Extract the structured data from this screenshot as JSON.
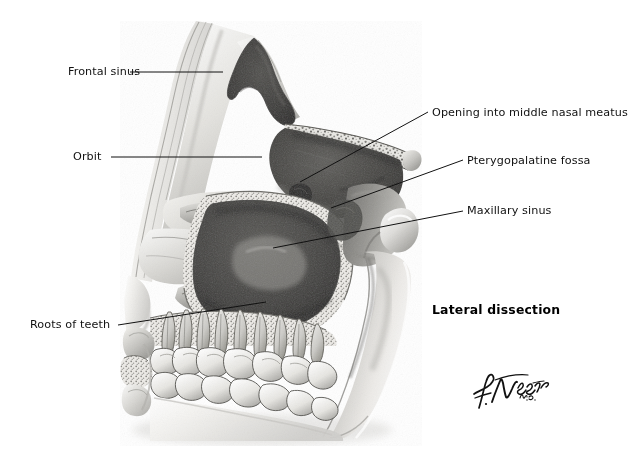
{
  "figure": {
    "style": "grayscale medical illustration",
    "background_color": "#ffffff",
    "ink_color": "#111111",
    "caption": "Lateral dissection",
    "signature": {
      "name": "F. Netter",
      "credential": "M.D."
    }
  },
  "labels": [
    {
      "id": "frontal-sinus",
      "text": "Frontal sinus",
      "side": "left",
      "text_x": 68,
      "text_y": 66,
      "text_w": 86,
      "leader": [
        [
          130,
          72
        ],
        [
          223,
          72
        ]
      ]
    },
    {
      "id": "orbit",
      "text": "Orbit",
      "side": "left",
      "text_x": 73,
      "text_y": 151,
      "text_w": 33,
      "leader": [
        [
          111,
          157
        ],
        [
          262,
          157
        ]
      ]
    },
    {
      "id": "opening-middle-nasal-meatus",
      "text": "Opening into middle nasal meatus",
      "side": "right",
      "text_x": 432,
      "text_y": 107,
      "text_w": 177,
      "leader": [
        [
          428,
          112
        ],
        [
          300,
          182
        ]
      ]
    },
    {
      "id": "pterygopalatine-fossa",
      "text": "Pterygopalatine fossa",
      "side": "right",
      "text_x": 467,
      "text_y": 155,
      "text_w": 114,
      "leader": [
        [
          463,
          160
        ],
        [
          331,
          208
        ]
      ]
    },
    {
      "id": "maxillary-sinus",
      "text": "Maxillary sinus",
      "side": "right",
      "text_x": 467,
      "text_y": 205,
      "text_w": 79,
      "leader": [
        [
          463,
          211
        ],
        [
          273,
          248
        ]
      ]
    },
    {
      "id": "roots-of-teeth",
      "text": "Roots of teeth",
      "side": "left",
      "text_x": 30,
      "text_y": 319,
      "text_w": 84,
      "leader": [
        [
          118,
          325
        ],
        [
          266,
          302
        ]
      ]
    }
  ],
  "caption_position": {
    "x": 432,
    "y": 302
  },
  "signature_position": {
    "x": 472,
    "y": 378
  }
}
